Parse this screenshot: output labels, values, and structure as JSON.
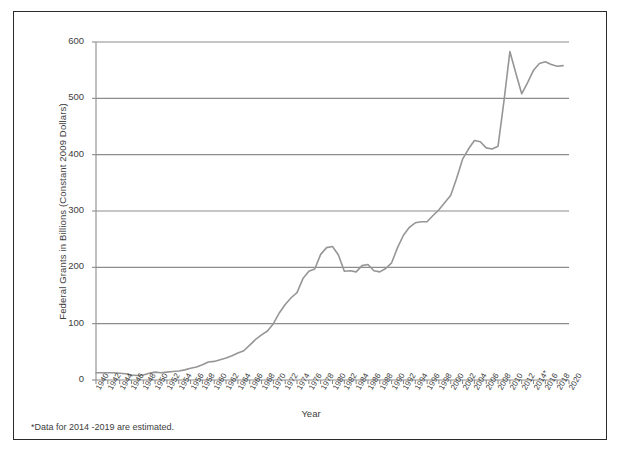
{
  "chart_data": {
    "type": "line",
    "title": "",
    "xlabel": "Year",
    "ylabel": "Federal Grants in Billions (Constant 2009 Dollars)",
    "xlim": [
      1940,
      2020
    ],
    "ylim": [
      0,
      600
    ],
    "ytick_values": [
      0,
      100,
      200,
      300,
      400,
      500,
      600
    ],
    "ytick_labels": [
      "0",
      "100",
      "200",
      "300",
      "400",
      "500",
      "600"
    ],
    "xtick_labels": [
      "1940",
      "1942",
      "1944",
      "1946",
      "1948",
      "1950",
      "1952",
      "1954",
      "1956",
      "1958",
      "1960",
      "1962",
      "1964",
      "1966",
      "1968",
      "1970",
      "1972",
      "1974",
      "1976",
      "1978",
      "1980",
      "1982",
      "1984",
      "1986",
      "1988",
      "1990",
      "1992",
      "1994",
      "1996",
      "1998",
      "2000",
      "2002",
      "2004",
      "2006",
      "2008",
      "2010",
      "2012",
      "2014*",
      "2016",
      "2018",
      "2020"
    ],
    "xtick_values": [
      1940,
      1942,
      1944,
      1946,
      1948,
      1950,
      1952,
      1954,
      1956,
      1958,
      1960,
      1962,
      1964,
      1966,
      1968,
      1970,
      1972,
      1974,
      1976,
      1978,
      1980,
      1982,
      1984,
      1986,
      1988,
      1990,
      1992,
      1994,
      1996,
      1998,
      2000,
      2002,
      2004,
      2006,
      2008,
      2010,
      2012,
      2014,
      2016,
      2018,
      2020
    ],
    "grid": "horizontal",
    "legend": "none",
    "line_color": "#969696",
    "grid_color": "#8c8c8c",
    "annotation": "*Data for 2014 -2019 are estimated.",
    "x": [
      1940,
      1941,
      1942,
      1943,
      1944,
      1945,
      1946,
      1947,
      1948,
      1949,
      1950,
      1951,
      1952,
      1953,
      1954,
      1955,
      1956,
      1957,
      1958,
      1959,
      1960,
      1961,
      1962,
      1963,
      1964,
      1965,
      1966,
      1967,
      1968,
      1969,
      1970,
      1971,
      1972,
      1973,
      1974,
      1975,
      1976,
      1977,
      1978,
      1979,
      1980,
      1981,
      1982,
      1983,
      1984,
      1985,
      1986,
      1987,
      1988,
      1989,
      1990,
      1991,
      1992,
      1993,
      1994,
      1995,
      1996,
      1997,
      1998,
      1999,
      2000,
      2001,
      2002,
      2003,
      2004,
      2005,
      2006,
      2007,
      2008,
      2009,
      2010,
      2011,
      2012,
      2013,
      2014,
      2015,
      2016,
      2017,
      2018,
      2019
    ],
    "y": [
      13,
      13,
      13,
      13,
      12,
      11,
      9,
      8,
      9,
      12,
      14,
      13,
      14,
      15,
      16,
      18,
      21,
      23,
      27,
      32,
      33,
      36,
      39,
      43,
      48,
      52,
      62,
      72,
      80,
      87,
      100,
      119,
      134,
      146,
      155,
      180,
      193,
      197,
      223,
      235,
      237,
      222,
      193,
      194,
      192,
      203,
      205,
      194,
      192,
      198,
      208,
      235,
      257,
      271,
      279,
      281,
      281,
      292,
      302,
      315,
      328,
      358,
      392,
      410,
      425,
      423,
      412,
      410,
      415,
      495,
      583,
      545,
      508,
      528,
      550,
      562,
      565,
      560,
      557,
      558
    ]
  },
  "axis_title_x": "Year",
  "axis_title_y": "Federal Grants in Billions (Constant 2009 Dollars)",
  "footnote": "*Data for 2014 -2019 are estimated."
}
